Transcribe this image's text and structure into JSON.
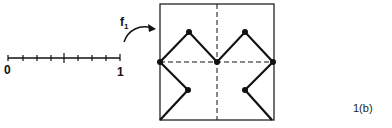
{
  "figure": {
    "caption": "1(b)",
    "map_label": "f",
    "map_label_sub": "1"
  },
  "number_line": {
    "start_label": "0",
    "end_label": "1",
    "x_start": 8,
    "x_end": 120,
    "y": 58,
    "tick_xs": [
      8,
      23,
      37,
      51,
      64,
      78,
      92,
      106,
      120
    ],
    "major_tick_index": 4
  },
  "square": {
    "left": 160,
    "top": 4,
    "right": 274,
    "bottom": 120,
    "dashed_vertical_x": 217,
    "dashed_horizontal_y": 62
  },
  "curve": {
    "upper_path": [
      [
        160,
        62
      ],
      [
        189,
        32
      ],
      [
        217,
        62
      ],
      [
        245,
        32
      ],
      [
        273,
        62
      ]
    ],
    "lower_left_path": [
      [
        160,
        62
      ],
      [
        188,
        90
      ],
      [
        160,
        120
      ]
    ],
    "lower_right_path": [
      [
        273,
        62
      ],
      [
        245,
        90
      ],
      [
        272,
        120
      ]
    ],
    "dots": [
      [
        160,
        62
      ],
      [
        189,
        32
      ],
      [
        217,
        62
      ],
      [
        245,
        32
      ],
      [
        273,
        62
      ],
      [
        188,
        90
      ],
      [
        245,
        90
      ]
    ]
  },
  "colors": {
    "ink": "#111111",
    "background": "#ffffff"
  }
}
